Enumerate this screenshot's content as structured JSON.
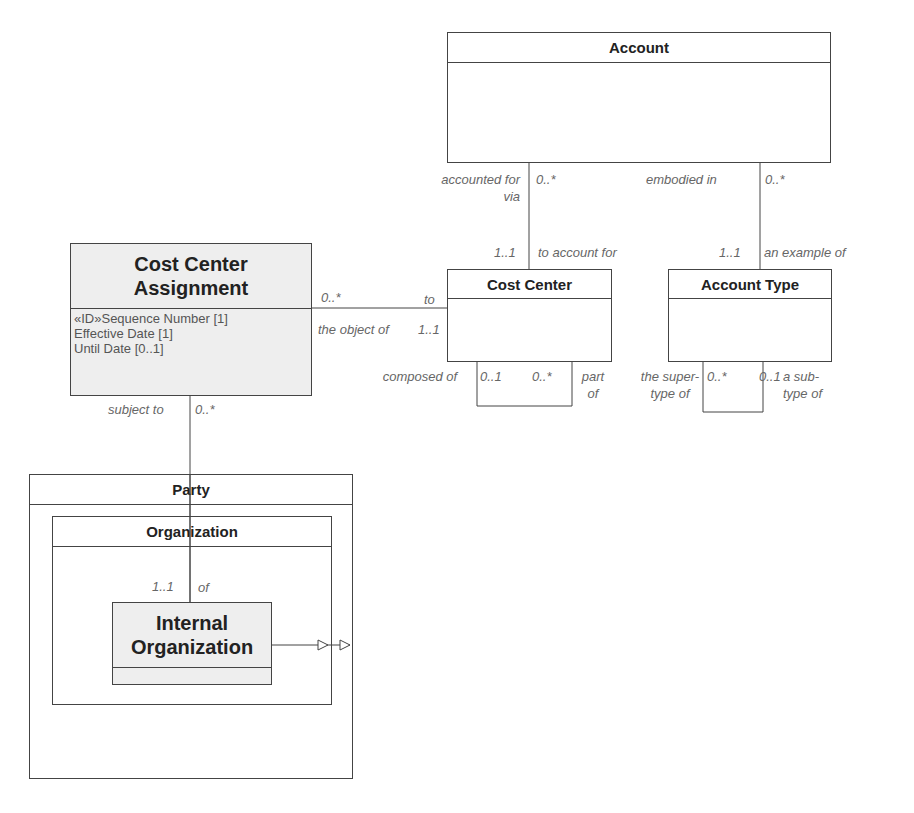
{
  "diagram": {
    "classes": {
      "account": {
        "name": "Account"
      },
      "cost_center": {
        "name": "Cost Center"
      },
      "account_type": {
        "name": "Account Type"
      },
      "cost_center_assignment": {
        "name": "Cost Center Assignment",
        "attributes": [
          "«ID»Sequence Number [1]",
          "Effective Date [1]",
          "Until Date [0..1]"
        ]
      },
      "party": {
        "name": "Party"
      },
      "organization": {
        "name": "Organization"
      },
      "internal_organization": {
        "name": "Internal Organization"
      }
    },
    "associations": {
      "account_cost_center": {
        "account_role": "accounted for via",
        "account_mult": "0..*",
        "cc_role": "to account for",
        "cc_mult": "1..1"
      },
      "account_account_type": {
        "account_role": "embodied in",
        "account_mult": "0..*",
        "type_role": "an example of",
        "type_mult": "1..1"
      },
      "cca_cost_center": {
        "cca_mult": "0..*",
        "cc_role_top": "to",
        "cc_role_bottom": "the object of",
        "cc_mult": "1..1"
      },
      "cost_center_self": {
        "left_role": "composed of",
        "left_mult": "0..1",
        "right_mult": "0..*",
        "right_role": "part of"
      },
      "account_type_self": {
        "left_role": "the super-type of",
        "left_mult": "0..*",
        "right_mult": "0..1",
        "right_role": "a sub-type of"
      },
      "cca_internal_org": {
        "cca_role": "subject to",
        "cca_mult": "0..*",
        "org_mult": "1..1",
        "org_role": "of"
      }
    },
    "colors": {
      "line": "#444444",
      "label": "#666666",
      "shaded_fill": "#eeeeee"
    }
  }
}
